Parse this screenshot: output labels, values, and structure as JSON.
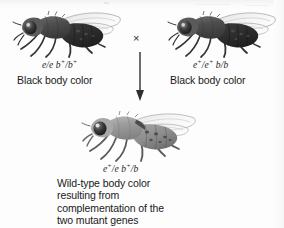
{
  "figure": {
    "kind": "genetics-complementation-diagram",
    "organism": "fruit fly",
    "background_color": "#fdfdfd",
    "cross_symbol": "×"
  },
  "parents": [
    {
      "id": "parent-left",
      "genotype_parts": {
        "allele1": "e/e",
        "allele2": "b",
        "allele2_sup": "+",
        "allele2_tail": "/b",
        "allele2_tail_sup": "+"
      },
      "genotype_plain": "e/e b+/b+",
      "phenotype": "Black body color",
      "body_color": "#4a4a4a"
    },
    {
      "id": "parent-right",
      "genotype_parts": {
        "allele1": "e",
        "allele1_sup": "+",
        "allele1_mid": "/e",
        "allele1_mid_sup": "+",
        "allele2": "b/b"
      },
      "genotype_plain": "e+/e+ b/b",
      "phenotype": "Black body color",
      "body_color": "#4a4a4a"
    }
  ],
  "offspring": {
    "id": "offspring",
    "genotype_plain": "e+/e b+/b",
    "genotype_parts": {
      "a": "e",
      "a_sup": "+",
      "b": "/e ",
      "c": "b",
      "c_sup": "+",
      "d": "/b"
    },
    "caption_lines": [
      "Wild-type body color",
      "resulting from",
      "complementation of the",
      "two mutant genes"
    ],
    "body_color": "#9a9a9a"
  },
  "icons": {
    "cross": "multiplication-cross-icon",
    "arrow": "down-arrow-icon",
    "fly": "fruit-fly-illustration"
  }
}
